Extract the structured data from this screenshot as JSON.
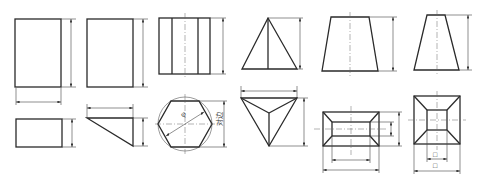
{
  "figure": {
    "line_color": "#2a2a2a",
    "background": "#ffffff"
  },
  "solids": [
    {
      "id": "rect-prism",
      "name": "Rectangular prism",
      "views": [
        "front",
        "top"
      ],
      "dims": [
        "height",
        "length",
        "width"
      ]
    },
    {
      "id": "triangular-prism",
      "name": "Triangular prism",
      "views": [
        "front",
        "top"
      ],
      "dims": [
        "height",
        "length",
        "width"
      ]
    },
    {
      "id": "hexagonal-prism",
      "name": "Hexagonal prism",
      "views": [
        "front",
        "top"
      ],
      "dims": [
        "height",
        "diameter",
        "across-flats"
      ]
    },
    {
      "id": "triangular-pyramid",
      "name": "Triangular pyramid",
      "views": [
        "front",
        "top"
      ],
      "dims": [
        "height",
        "base-length",
        "base-depth"
      ]
    },
    {
      "id": "frustum-rect",
      "name": "Rectangular frustum",
      "views": [
        "front",
        "top"
      ],
      "dims": [
        "height",
        "top-length",
        "bottom-length",
        "top-width",
        "bottom-width"
      ]
    },
    {
      "id": "frustum-square",
      "name": "Square frustum",
      "views": [
        "front",
        "top"
      ],
      "dims": [
        "height",
        "top-side",
        "bottom-side"
      ]
    }
  ],
  "labels": {
    "diameter_symbol": "φ",
    "across_flats": "对边",
    "square_symbol_top": "□",
    "square_symbol_bottom": "□"
  }
}
